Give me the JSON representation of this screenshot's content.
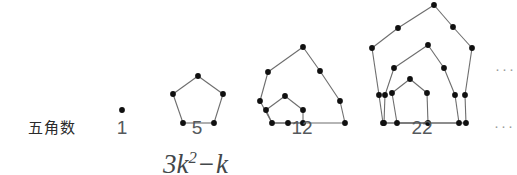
{
  "figure": {
    "row_label": "五角数",
    "counts": [
      {
        "value": "1",
        "cx": 122
      },
      {
        "value": "5",
        "cx": 197
      },
      {
        "value": "12",
        "cx": 302
      },
      {
        "value": "22",
        "cx": 422
      }
    ],
    "ellipsis_top": "···",
    "ellipsis_bottom": "···",
    "formula": {
      "coefficient": "3",
      "variable": "k",
      "exponent": "2",
      "operator": "−",
      "term": "k",
      "full": "3k² − k"
    },
    "colors": {
      "node": "#101010",
      "edge": "#6d6d6d",
      "text": "#55595c",
      "label": "#2b2b2b",
      "background": "#ffffff"
    },
    "stages": [
      {
        "name": "pentagonal-1",
        "dot_count": 1,
        "nodes": [
          [
            122,
            110
          ]
        ],
        "edges": []
      },
      {
        "name": "pentagonal-5",
        "dot_count": 5,
        "nodes": [
          [
            198,
            76
          ],
          [
            173,
            94
          ],
          [
            183,
            123
          ],
          [
            214,
            123
          ],
          [
            223,
            94
          ]
        ],
        "edges": [
          [
            0,
            1
          ],
          [
            1,
            2
          ],
          [
            2,
            3
          ],
          [
            3,
            4
          ],
          [
            4,
            0
          ]
        ]
      },
      {
        "name": "pentagonal-12",
        "dot_count": 12,
        "nodes": [
          [
            285,
            96
          ],
          [
            266,
            110
          ],
          [
            272,
            123
          ],
          [
            303,
            123
          ],
          [
            303,
            110
          ],
          [
            303,
            47
          ],
          [
            268,
            72
          ],
          [
            260,
            101
          ],
          [
            288,
            123
          ],
          [
            345,
            123
          ],
          [
            340,
            101
          ],
          [
            320,
            71
          ]
        ],
        "edges": [
          [
            0,
            1
          ],
          [
            1,
            2
          ],
          [
            2,
            3
          ],
          [
            3,
            4
          ],
          [
            4,
            0
          ],
          [
            5,
            6
          ],
          [
            6,
            7
          ],
          [
            7,
            2
          ],
          [
            2,
            8
          ],
          [
            8,
            9
          ],
          [
            9,
            10
          ],
          [
            10,
            11
          ],
          [
            11,
            5
          ]
        ]
      },
      {
        "name": "pentagonal-22",
        "dot_count": 22,
        "nodes": [
          [
            410,
            79
          ],
          [
            392,
            93
          ],
          [
            397,
            123
          ],
          [
            428,
            123
          ],
          [
            427,
            93
          ],
          [
            428,
            45
          ],
          [
            394,
            68
          ],
          [
            385,
            95
          ],
          [
            384,
            123
          ],
          [
            459,
            123
          ],
          [
            455,
            95
          ],
          [
            444,
            68
          ],
          [
            434,
            5
          ],
          [
            398,
            28
          ],
          [
            372,
            48
          ],
          [
            379,
            95
          ],
          [
            383,
            123
          ],
          [
            466,
            123
          ],
          [
            465,
            95
          ],
          [
            472,
            48
          ],
          [
            453,
            27
          ]
        ],
        "edges": [
          [
            0,
            1
          ],
          [
            1,
            2
          ],
          [
            2,
            3
          ],
          [
            3,
            4
          ],
          [
            4,
            0
          ],
          [
            5,
            6
          ],
          [
            6,
            7
          ],
          [
            7,
            8
          ],
          [
            8,
            3
          ],
          [
            3,
            9
          ],
          [
            9,
            10
          ],
          [
            10,
            11
          ],
          [
            11,
            5
          ],
          [
            12,
            13
          ],
          [
            13,
            14
          ],
          [
            14,
            15
          ],
          [
            15,
            16
          ],
          [
            16,
            9
          ],
          [
            9,
            17
          ],
          [
            17,
            18
          ],
          [
            18,
            19
          ],
          [
            19,
            20
          ],
          [
            20,
            12
          ]
        ]
      }
    ]
  }
}
